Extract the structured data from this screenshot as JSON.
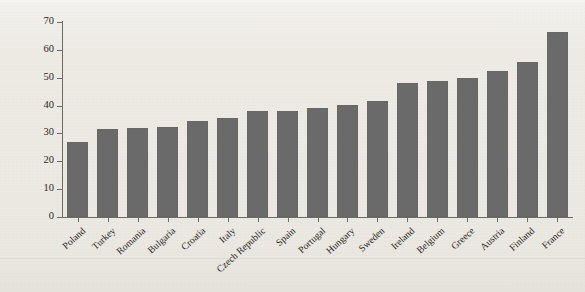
{
  "chart_data": {
    "type": "bar",
    "title": "",
    "xlabel": "",
    "ylabel": "respondents, %",
    "ylim": [
      0,
      70
    ],
    "yticks": [
      0,
      10,
      20,
      30,
      40,
      50,
      60,
      70
    ],
    "grid": false,
    "legend": "none",
    "bar_color": "#6a6a6a",
    "background_color": "#eeebe5",
    "axis_color": "#6c6a66",
    "categories": [
      "Poland",
      "Turkey",
      "Romania",
      "Bulgaria",
      "Croatia",
      "Italy",
      "Czech Republic",
      "Spain",
      "Portugal",
      "Hungary",
      "Sweden",
      "Ireland",
      "Belgium",
      "Greece",
      "Austria",
      "Finland",
      "France"
    ],
    "values": [
      27,
      31.5,
      32,
      32.3,
      34.5,
      35.5,
      38,
      38.2,
      39,
      40.3,
      41.5,
      48,
      49,
      49.8,
      52.3,
      55.5,
      66.3
    ]
  }
}
